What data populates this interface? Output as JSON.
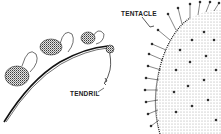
{
  "figure": {
    "type": "botanical illustration",
    "labels": {
      "tentacle": "TENTACLE",
      "tendril": "TENDRIL"
    },
    "panels": [
      {
        "name": "climbing-stem-with-tendrils",
        "label": "TENDRIL"
      },
      {
        "name": "sundew-leaf-with-tentacles",
        "label": "TENTACLE"
      }
    ],
    "colors": {
      "ink": "#1a1a1a",
      "background": "#ffffff"
    }
  }
}
